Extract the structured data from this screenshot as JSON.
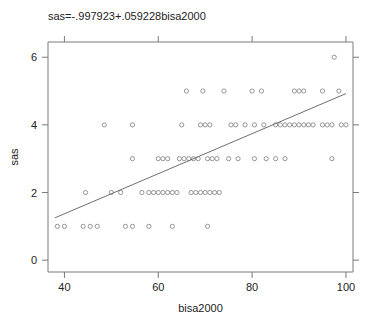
{
  "chart_data": {
    "type": "scatter",
    "title": "sas=-.997923+.059228bisa2000",
    "xlabel": "bisa2000",
    "ylabel": "sas",
    "xlim": [
      36.5,
      101.5
    ],
    "ylim": [
      -0.35,
      6.45
    ],
    "xticks": [
      40,
      60,
      80,
      100
    ],
    "yticks": [
      0,
      2,
      4,
      6
    ],
    "grid": false,
    "legend": null,
    "marker": "open-circle",
    "marker_color": "#8a8a8a",
    "line_color": "#6e6e6e",
    "regression": {
      "equation": "sas=-.997923+.059228bisa2000",
      "intercept": -0.997923,
      "slope": 0.059228,
      "x_start": 38,
      "x_end": 100
    },
    "points": [
      {
        "x": 38.5,
        "y": 1
      },
      {
        "x": 40.0,
        "y": 1
      },
      {
        "x": 44.0,
        "y": 1
      },
      {
        "x": 45.5,
        "y": 1
      },
      {
        "x": 47.0,
        "y": 1
      },
      {
        "x": 53.0,
        "y": 1
      },
      {
        "x": 54.5,
        "y": 1
      },
      {
        "x": 58.0,
        "y": 1
      },
      {
        "x": 63.0,
        "y": 1
      },
      {
        "x": 70.5,
        "y": 1
      },
      {
        "x": 44.5,
        "y": 2
      },
      {
        "x": 50.0,
        "y": 2
      },
      {
        "x": 52.0,
        "y": 2
      },
      {
        "x": 56.5,
        "y": 2
      },
      {
        "x": 58.0,
        "y": 2
      },
      {
        "x": 59.0,
        "y": 2
      },
      {
        "x": 60.0,
        "y": 2
      },
      {
        "x": 61.0,
        "y": 2
      },
      {
        "x": 62.0,
        "y": 2
      },
      {
        "x": 63.0,
        "y": 2
      },
      {
        "x": 64.0,
        "y": 2
      },
      {
        "x": 67.0,
        "y": 2
      },
      {
        "x": 68.0,
        "y": 2
      },
      {
        "x": 69.0,
        "y": 2
      },
      {
        "x": 70.0,
        "y": 2
      },
      {
        "x": 71.0,
        "y": 2
      },
      {
        "x": 72.0,
        "y": 2
      },
      {
        "x": 73.0,
        "y": 2
      },
      {
        "x": 54.5,
        "y": 3
      },
      {
        "x": 60.0,
        "y": 3
      },
      {
        "x": 61.0,
        "y": 3
      },
      {
        "x": 62.0,
        "y": 3
      },
      {
        "x": 64.5,
        "y": 3
      },
      {
        "x": 65.5,
        "y": 3
      },
      {
        "x": 66.5,
        "y": 3
      },
      {
        "x": 67.5,
        "y": 3
      },
      {
        "x": 68.5,
        "y": 3
      },
      {
        "x": 70.5,
        "y": 3
      },
      {
        "x": 71.5,
        "y": 3
      },
      {
        "x": 72.5,
        "y": 3
      },
      {
        "x": 75.0,
        "y": 3
      },
      {
        "x": 77.0,
        "y": 3
      },
      {
        "x": 80.5,
        "y": 3
      },
      {
        "x": 83.0,
        "y": 3
      },
      {
        "x": 85.0,
        "y": 3
      },
      {
        "x": 87.0,
        "y": 3
      },
      {
        "x": 97.0,
        "y": 3
      },
      {
        "x": 48.5,
        "y": 4
      },
      {
        "x": 54.5,
        "y": 4
      },
      {
        "x": 65.0,
        "y": 4
      },
      {
        "x": 69.0,
        "y": 4
      },
      {
        "x": 70.0,
        "y": 4
      },
      {
        "x": 71.0,
        "y": 4
      },
      {
        "x": 75.5,
        "y": 4
      },
      {
        "x": 76.5,
        "y": 4
      },
      {
        "x": 78.5,
        "y": 4
      },
      {
        "x": 80.5,
        "y": 4
      },
      {
        "x": 82.5,
        "y": 4
      },
      {
        "x": 85.0,
        "y": 4
      },
      {
        "x": 86.0,
        "y": 4
      },
      {
        "x": 87.0,
        "y": 4
      },
      {
        "x": 88.0,
        "y": 4
      },
      {
        "x": 89.0,
        "y": 4
      },
      {
        "x": 90.0,
        "y": 4
      },
      {
        "x": 91.0,
        "y": 4
      },
      {
        "x": 92.0,
        "y": 4
      },
      {
        "x": 93.0,
        "y": 4
      },
      {
        "x": 95.0,
        "y": 4
      },
      {
        "x": 96.0,
        "y": 4
      },
      {
        "x": 97.0,
        "y": 4
      },
      {
        "x": 99.0,
        "y": 4
      },
      {
        "x": 100.0,
        "y": 4
      },
      {
        "x": 66.0,
        "y": 5
      },
      {
        "x": 69.5,
        "y": 5
      },
      {
        "x": 74.0,
        "y": 5
      },
      {
        "x": 80.0,
        "y": 5
      },
      {
        "x": 82.0,
        "y": 5
      },
      {
        "x": 89.0,
        "y": 5
      },
      {
        "x": 90.0,
        "y": 5
      },
      {
        "x": 91.0,
        "y": 5
      },
      {
        "x": 95.0,
        "y": 5
      },
      {
        "x": 98.5,
        "y": 5
      },
      {
        "x": 97.5,
        "y": 6
      }
    ]
  }
}
